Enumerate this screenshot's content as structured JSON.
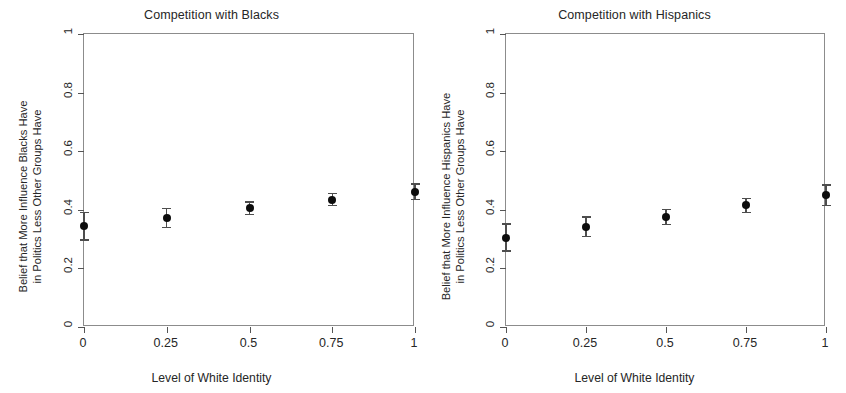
{
  "figure": {
    "xlabel": "Level of White Identity",
    "x_ticks": [
      "0",
      "0.25",
      "0.5",
      "0.75",
      "1"
    ],
    "y_ticks": [
      "0",
      "0.2",
      "0.4",
      "0.6",
      "0.8",
      "1"
    ]
  },
  "panels": [
    {
      "id": "blacks",
      "title": "Competition with Blacks",
      "ylabel": "Belief that More Influence Blacks Have\nin Politics Less Other Groups Have"
    },
    {
      "id": "hispanics",
      "title": "Competition with Hispanics",
      "ylabel": "Belief that More Influence Hispanics Have\nin Politics Less Other Groups Have"
    }
  ],
  "chart_data": [
    {
      "type": "scatter",
      "title": "Competition with Blacks",
      "xlabel": "Level of White Identity",
      "ylabel": "Belief that More Influence Blacks Have in Politics Less Other Groups Have",
      "xlim": [
        0,
        1
      ],
      "ylim": [
        0,
        1
      ],
      "xticks": [
        0,
        0.25,
        0.5,
        0.75,
        1
      ],
      "yticks": [
        0,
        0.2,
        0.4,
        0.6,
        0.8,
        1
      ],
      "grid": false,
      "legend": "none",
      "errorbars": true,
      "x": [
        0,
        0.25,
        0.5,
        0.75,
        1
      ],
      "values": [
        0.345,
        0.372,
        0.405,
        0.435,
        0.462
      ],
      "yerr_low": [
        0.048,
        0.032,
        0.022,
        0.02,
        0.026
      ],
      "yerr_high": [
        0.045,
        0.032,
        0.022,
        0.02,
        0.026
      ]
    },
    {
      "type": "scatter",
      "title": "Competition with Hispanics",
      "xlabel": "Level of White Identity",
      "ylabel": "Belief that More Influence Hispanics Have in Politics Less Other Groups Have",
      "xlim": [
        0,
        1
      ],
      "ylim": [
        0,
        1
      ],
      "xticks": [
        0,
        0.25,
        0.5,
        0.75,
        1
      ],
      "yticks": [
        0,
        0.2,
        0.4,
        0.6,
        0.8,
        1
      ],
      "grid": false,
      "legend": "none",
      "errorbars": true,
      "x": [
        0,
        0.25,
        0.5,
        0.75,
        1
      ],
      "values": [
        0.305,
        0.342,
        0.375,
        0.415,
        0.45
      ],
      "yerr_low": [
        0.046,
        0.034,
        0.026,
        0.024,
        0.035
      ],
      "yerr_high": [
        0.046,
        0.034,
        0.026,
        0.024,
        0.035
      ]
    }
  ]
}
